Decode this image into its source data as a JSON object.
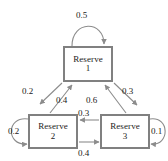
{
  "diagram": {
    "type": "directed-graph",
    "nodes": [
      {
        "id": "1",
        "label": "Reserve",
        "sublabel": "1"
      },
      {
        "id": "2",
        "label": "Reserve",
        "sublabel": "2"
      },
      {
        "id": "3",
        "label": "Reserve",
        "sublabel": "3"
      }
    ],
    "edges": [
      {
        "from": "1",
        "to": "1",
        "label": "0.5",
        "kind": "self-loop",
        "side": "top"
      },
      {
        "from": "1",
        "to": "2",
        "label": "0.2",
        "kind": "diagonal",
        "side": "left-outer"
      },
      {
        "from": "2",
        "to": "1",
        "label": "0.4",
        "kind": "diagonal",
        "side": "left-inner"
      },
      {
        "from": "3",
        "to": "1",
        "label": "0.6",
        "kind": "diagonal",
        "side": "right-inner"
      },
      {
        "from": "1",
        "to": "3",
        "label": "0.3",
        "kind": "diagonal",
        "side": "right-outer"
      },
      {
        "from": "3",
        "to": "2",
        "label": "0.3",
        "kind": "horizontal",
        "side": "upper"
      },
      {
        "from": "2",
        "to": "3",
        "label": "0.4",
        "kind": "horizontal",
        "side": "lower"
      },
      {
        "from": "2",
        "to": "2",
        "label": "0.2",
        "kind": "self-loop",
        "side": "left"
      },
      {
        "from": "3",
        "to": "3",
        "label": "0.1",
        "kind": "self-loop",
        "side": "right"
      }
    ],
    "colors": {
      "node_border": "#808080",
      "node_fill": "#ffffff",
      "edge": "#8c8c8c",
      "text": "#1a1a1a",
      "background": "#ffffff"
    }
  }
}
